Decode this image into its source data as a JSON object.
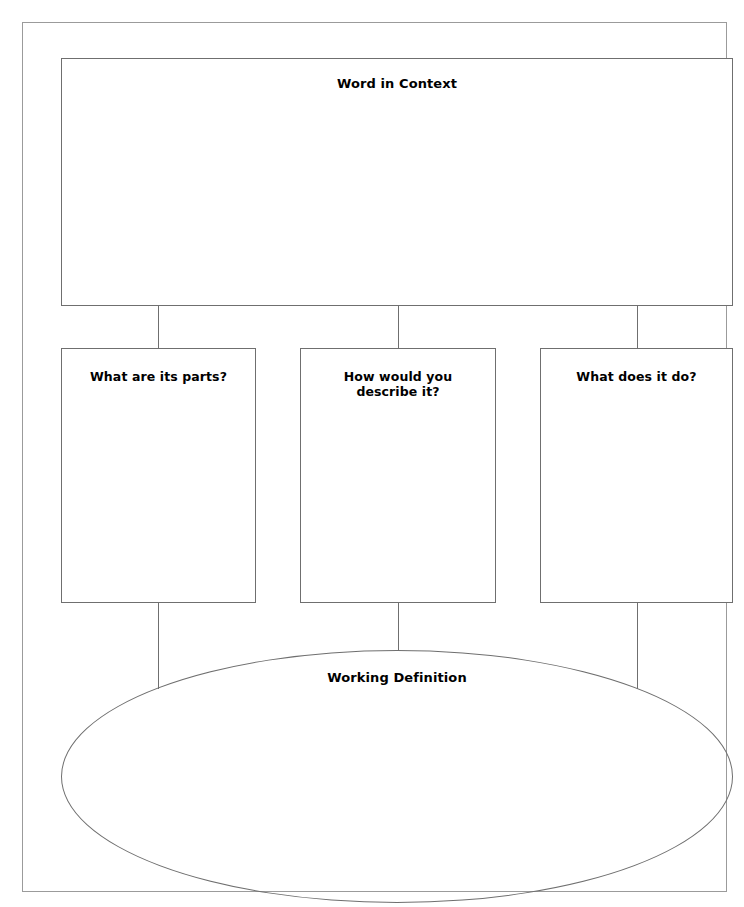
{
  "worksheet": {
    "title": "Word in Context",
    "top_box": {
      "label": "Word in Context",
      "content": ""
    },
    "branches": [
      {
        "label": "What are its parts?",
        "content": ""
      },
      {
        "label_line1": "How would you",
        "label_line2": "describe it?",
        "content": ""
      },
      {
        "label": "What does it do?",
        "content": ""
      }
    ],
    "conclusion": {
      "label": "Working Definition",
      "content": ""
    },
    "colors": {
      "page_border": "#9b9b9b",
      "shape_border": "#6f6f6f",
      "text": "#000000",
      "background": "#ffffff"
    }
  }
}
